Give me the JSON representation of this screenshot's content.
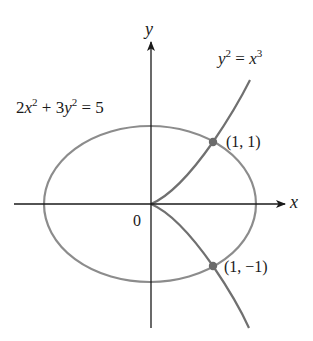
{
  "figure": {
    "axes": {
      "x_label": "x",
      "y_label": "y",
      "origin_label": "0"
    },
    "curves": {
      "ellipse": {
        "equation_parts": {
          "c1": "2",
          "v1": "x",
          "p1": "2",
          "plus": " + 3",
          "v2": "y",
          "p2": "2",
          "eq": " = 5"
        },
        "equation": "2x^2 + 3y^2 = 5",
        "stroke": "#8a8a8a"
      },
      "cusp": {
        "equation_parts": {
          "v1": "y",
          "p1": "2",
          "eq": " = ",
          "v2": "x",
          "p2": "3"
        },
        "equation": "y^2 = x^3",
        "stroke": "#6e6e6e"
      }
    },
    "points": [
      {
        "label": "(1, 1)",
        "x": 1,
        "y": 1
      },
      {
        "label": "(1, −1)",
        "x": 1,
        "y": -1
      }
    ],
    "colors": {
      "axis": "#1a1a1a",
      "curve": "#7a7a7a",
      "point": "#6a6a6a",
      "text": "#1a1a1a"
    }
  }
}
